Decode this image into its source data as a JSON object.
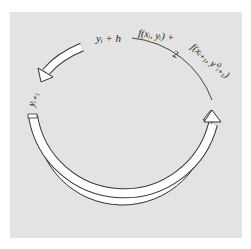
{
  "diagram": {
    "type": "cycle",
    "labels": {
      "top_left": "yᵢ + h",
      "top_right_numerator": "f(xᵢ, yᵢ) + f(xᵢ₊₁, y⁰ᵢ₊₁)",
      "top_right_denominator": "2",
      "left": "yᵢ₊₁"
    },
    "arrows": [
      {
        "name": "short-arrow",
        "from": "yi + h",
        "to": "yi+1",
        "direction": "counterclockwise"
      },
      {
        "name": "large-arc-arrow",
        "from": "yi+1",
        "to": "slope-average",
        "direction": "counterclockwise-bottom"
      }
    ],
    "colors": {
      "background": "#e3e3e3",
      "arrow_fill": "#ffffff",
      "stroke": "#333333"
    }
  }
}
